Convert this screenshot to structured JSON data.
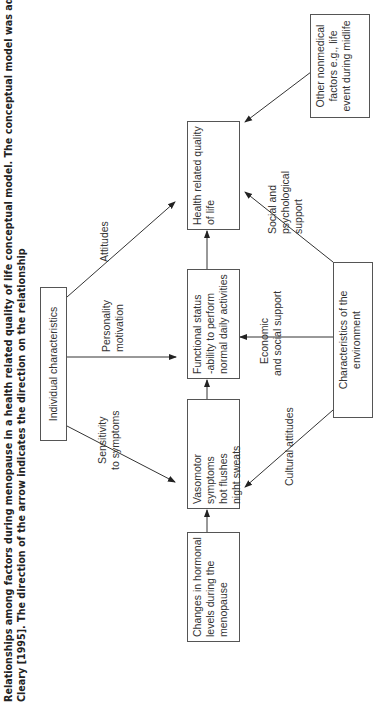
{
  "caption": {
    "line1": "Relationships among factors during menopause in a health related quality of life conceptual model. The conceptual model was adapted from W",
    "line2": "Cleary [1995]. The direction of the arrow indicates the direction on the relationship"
  },
  "nodes": {
    "hormonal": {
      "l1": "Changes in hormonal",
      "l2": "levels during the",
      "l3": "menopause"
    },
    "vasomotor": {
      "l1": "Vasomotor symptoms",
      "l2": "hot flushes",
      "l3": "night sweats"
    },
    "functional": {
      "l1": "Functional status",
      "l2": "-ability to perform",
      "l3": "normal daily activities"
    },
    "hrqol": {
      "l1": "Health related quality",
      "l2": "of life"
    },
    "individual": {
      "l1": "Individual characteristics"
    },
    "environment": {
      "l1": "Characteristics of the",
      "l2": "environment"
    },
    "other": {
      "l1": "Other nonmedical",
      "l2": "factors e.g., life",
      "l3": "event during midlife"
    }
  },
  "edges": {
    "sensitivity": {
      "l1": "Sensitivity",
      "l2": "to symptoms"
    },
    "personality": {
      "l1": "Personality",
      "l2": "motivation"
    },
    "attitudes": {
      "l1": "Attitudes"
    },
    "cultural": {
      "l1": "Cultural attitudes"
    },
    "economic": {
      "l1": "Economic",
      "l2": "and social support"
    },
    "social": {
      "l1": "Social and",
      "l2": "psychological",
      "l3": "support"
    }
  }
}
